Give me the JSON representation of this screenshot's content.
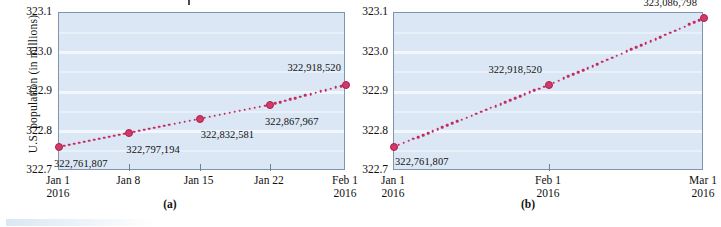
{
  "figure": {
    "panels": [
      "a",
      "b"
    ],
    "caption_a": "(a)",
    "caption_b": "(b)",
    "axis_line_color": "#7e95b0",
    "plot_background_color": "#dbe7f4",
    "gridline_color": "#f3f8fd",
    "series_color": "#c32b5e",
    "marker_color": "#d33a68"
  },
  "chart_data": [
    {
      "type": "line",
      "panel": "(a)",
      "title": "",
      "xlabel": "",
      "ylabel": "U.S. population (in millions)",
      "ylim": [
        322.7,
        323.1
      ],
      "yticks": [
        "322.7",
        "322.8",
        "322.9",
        "323.0",
        "323.1"
      ],
      "grid": true,
      "legend": "none",
      "xticks": [
        {
          "label": "Jan 1",
          "year": "2016"
        },
        {
          "label": "Jan 8",
          "year": ""
        },
        {
          "label": "Jan 15",
          "year": ""
        },
        {
          "label": "Jan 22",
          "year": ""
        },
        {
          "label": "Feb 1",
          "year": "2016"
        }
      ],
      "points": [
        {
          "x": "Jan 1",
          "y": 322.761807,
          "label": "322,761,807"
        },
        {
          "x": "Jan 8",
          "y": 322.797194,
          "label": "322,797,194"
        },
        {
          "x": "Jan 15",
          "y": 322.832581,
          "label": "322,832,581"
        },
        {
          "x": "Jan 22",
          "y": 322.867967,
          "label": "322,867,967"
        },
        {
          "x": "Feb 1",
          "y": 322.91852,
          "label": "322,918,520"
        }
      ]
    },
    {
      "type": "line",
      "panel": "(b)",
      "title": "",
      "xlabel": "",
      "ylabel": "",
      "ylim": [
        322.7,
        323.1
      ],
      "yticks": [
        "322.7",
        "322.8",
        "322.9",
        "323.0",
        "323.1"
      ],
      "grid": true,
      "legend": "none",
      "xticks": [
        {
          "label": "Jan 1",
          "year": "2016"
        },
        {
          "label": "Feb 1",
          "year": "2016"
        },
        {
          "label": "Mar 1",
          "year": "2016"
        }
      ],
      "points": [
        {
          "x": "Jan 1",
          "y": 322.761807,
          "label": "322,761,807"
        },
        {
          "x": "Feb 1",
          "y": 322.91852,
          "label": "322,918,520"
        },
        {
          "x": "Mar 1",
          "y": 323.086798,
          "label": "323,086,798"
        }
      ]
    }
  ]
}
